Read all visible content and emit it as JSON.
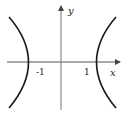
{
  "diagram": {
    "type": "hyperbola",
    "equation_hint": "x^2 - y^2 = 1",
    "axes": {
      "x_label": "x",
      "y_label": "y"
    },
    "ticks": {
      "left_vertex": "-1",
      "right_vertex": "1"
    },
    "colors": {
      "curve": "#1a1a1a",
      "axis": "#555555",
      "background": "#ffffff"
    }
  }
}
